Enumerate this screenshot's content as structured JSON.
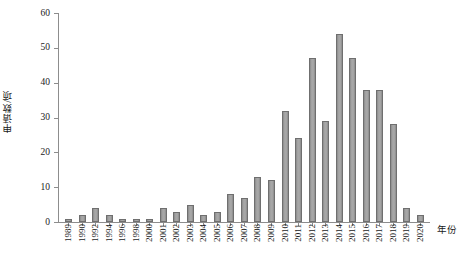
{
  "chart_data": {
    "type": "bar",
    "title": "",
    "subtitle": "",
    "xlabel": "年份",
    "ylabel": "申请数/项",
    "ylim": [
      0,
      60
    ],
    "yticks": [
      0,
      10,
      20,
      30,
      40,
      50,
      60
    ],
    "grid": false,
    "legend": null,
    "bar_color": "#9c9c9c",
    "bar_edge_color": "#6f6f6f",
    "axis_color": "#8d8d8d",
    "categories": [
      "1989",
      "1990",
      "1992",
      "1994",
      "1996",
      "1998",
      "2000",
      "2001",
      "2002",
      "2003",
      "2004",
      "2005",
      "2006",
      "2007",
      "2008",
      "2009",
      "2010",
      "2011",
      "2012",
      "2013",
      "2014",
      "2015",
      "2016",
      "2017",
      "2018",
      "2019",
      "2020"
    ],
    "values": [
      1,
      2,
      4,
      2,
      1,
      1,
      1,
      4,
      3,
      5,
      2,
      3,
      8,
      7,
      13,
      12,
      32,
      24,
      47,
      29,
      54,
      47,
      38,
      38,
      28,
      4,
      2
    ]
  }
}
